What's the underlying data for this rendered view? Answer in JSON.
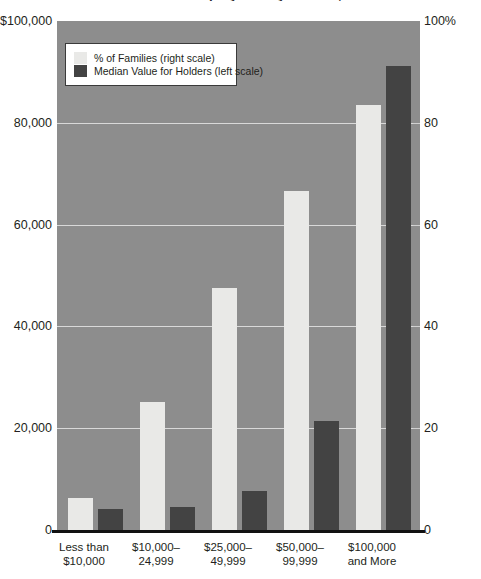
{
  "chart_data": {
    "type": "bar",
    "title": "Stock Ownership by Family Income, 1995",
    "categories": [
      {
        "line1": "Less than",
        "line2": "$10,000"
      },
      {
        "line1": "$10,000–",
        "line2": "24,999"
      },
      {
        "line1": "$25,000–",
        "line2": "49,999"
      },
      {
        "line1": "$50,000–",
        "line2": "99,999"
      },
      {
        "line1": "$100,000",
        "line2": "and More"
      }
    ],
    "series": [
      {
        "name": "% of Families (right scale)",
        "axis": "right",
        "color": "#e9e9e7",
        "values": [
          6.3,
          25.1,
          47.5,
          66.6,
          83.5
        ]
      },
      {
        "name": "Median Value for Holders (left scale)",
        "axis": "left",
        "color": "#434343",
        "values": [
          4200,
          4500,
          7700,
          21500,
          91200
        ]
      }
    ],
    "yleft": {
      "label": "",
      "ylim": [
        0,
        100000
      ],
      "ticks": [
        "$100,000",
        "80,000",
        "60,000",
        "40,000",
        "20,000",
        "0"
      ],
      "tick_values": [
        100000,
        80000,
        60000,
        40000,
        20000,
        0
      ]
    },
    "yright": {
      "label": "",
      "ylim": [
        0,
        100
      ],
      "ticks": [
        "100%",
        "80",
        "60",
        "40",
        "20",
        "0"
      ],
      "tick_values": [
        100,
        80,
        60,
        40,
        20,
        0
      ]
    },
    "xlabel": "",
    "grid": true,
    "legend_position": "top-left",
    "legend": [
      {
        "label": "% of Families (right scale)",
        "color": "#e9e9e7"
      },
      {
        "label": "Median Value for Holders (left scale)",
        "color": "#434343"
      }
    ],
    "colors": {
      "plot_background": "#8d8d8d",
      "gridline": "#d9d9d9",
      "light_bar": "#e9e9e7",
      "dark_bar": "#434343",
      "axis": "#111111",
      "text": "#231f20"
    }
  }
}
